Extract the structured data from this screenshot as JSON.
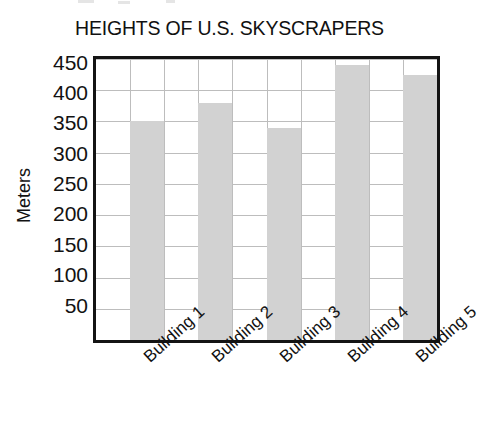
{
  "chart_data": {
    "type": "bar",
    "title": "HEIGHTS OF U.S. SKYSCRAPERS",
    "xlabel": "",
    "ylabel": "Meters",
    "categories": [
      "Building 1",
      "Building 2",
      "Building 3",
      "Building 4",
      "Building 5"
    ],
    "values": [
      350,
      380,
      340,
      440,
      425
    ],
    "ylim": [
      0,
      450
    ],
    "ytick_labels": [
      "450",
      "400",
      "350",
      "300",
      "250",
      "200",
      "150",
      "100",
      "50"
    ],
    "ytick_values": [
      450,
      400,
      350,
      300,
      250,
      200,
      150,
      100,
      50
    ],
    "grid": true,
    "legend": "none",
    "bar_color": "#d2d2d2",
    "frame_color": "#141414",
    "gridline_color": "#bdbdbd",
    "background_color": "#ffffff",
    "xtick_rotation_degrees": -42
  }
}
